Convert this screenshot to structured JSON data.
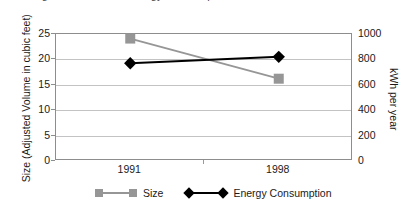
{
  "chart_data": {
    "type": "line",
    "title": "",
    "cropped_title_remnant": "Refrigerator Size and Energy Consumption",
    "categories": [
      "1991",
      "1998"
    ],
    "xlabel": "",
    "grid": "horizontal",
    "legend_position": "bottom",
    "axes": {
      "left": {
        "label": "Size (Adjusted Volume in cubic feet)",
        "ticks": [
          "0",
          "5",
          "10",
          "15",
          "20",
          "25"
        ],
        "tick_values": [
          0,
          5,
          10,
          15,
          20,
          25
        ],
        "ylim": [
          0,
          25
        ]
      },
      "right": {
        "label": "kWh per year",
        "ticks": [
          "0",
          "200",
          "400",
          "600",
          "800",
          "1000"
        ],
        "tick_values": [
          0,
          200,
          400,
          600,
          800,
          1000
        ],
        "ylim": [
          0,
          1000
        ]
      }
    },
    "series": [
      {
        "name": "Size",
        "axis": "left",
        "color": "#969696",
        "marker": "square",
        "values": [
          24.1,
          16.2
        ]
      },
      {
        "name": "Energy Consumption",
        "axis": "right",
        "color": "#000000",
        "marker": "diamond",
        "values": [
          770,
          820
        ]
      }
    ]
  },
  "legend": {
    "entries": [
      {
        "label": "Size"
      },
      {
        "label": "Energy Consumption"
      }
    ]
  },
  "colors": {
    "size_series": "#969696",
    "energy_series": "#000000",
    "gridline": "#c3c3c3",
    "axis_border": "#8d8d8d",
    "text": "#1a1a1a",
    "background": "#ffffff"
  }
}
